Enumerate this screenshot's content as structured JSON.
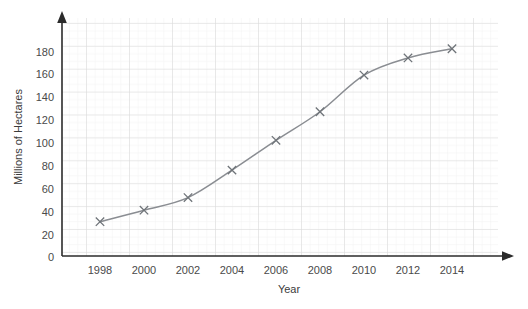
{
  "chart_data": {
    "type": "line",
    "title": "",
    "xlabel": "Year",
    "ylabel": "Millions of Hectares",
    "x": [
      1998,
      2000,
      2002,
      2004,
      2006,
      2008,
      2010,
      2012,
      2014
    ],
    "values": [
      30,
      40,
      51,
      75,
      101,
      126,
      158,
      173,
      181
    ],
    "categories": [
      "1998",
      "2000",
      "2002",
      "2004",
      "2006",
      "2008",
      "2010",
      "2012",
      "2014"
    ],
    "series": [
      {
        "name": "Millions of Hectares",
        "values": [
          30,
          40,
          51,
          75,
          101,
          126,
          158,
          173,
          181
        ]
      }
    ],
    "xlim": [
      1996,
      2016
    ],
    "ylim": [
      0,
      190
    ],
    "xticks": [
      "1998",
      "2000",
      "2002",
      "2004",
      "2006",
      "2008",
      "2010",
      "2012",
      "2014"
    ],
    "yticks": [
      "0",
      "20",
      "40",
      "60",
      "80",
      "100",
      "120",
      "140",
      "160",
      "180"
    ],
    "grid": true,
    "legend": "none",
    "marker": "x",
    "line_color": "#8a8d92",
    "marker_color": "#6f7479",
    "grid_color": "#dcdcdc",
    "minor_grid_color": "#efefef",
    "axis_color": "#2b2b2b",
    "text_color": "#4a4a4a",
    "background": "#ffffff"
  },
  "axes": {
    "y_title": "Millions of Hectares",
    "x_title": "Year",
    "y_tick_labels": [
      "180",
      "160",
      "140",
      "120",
      "100",
      "80",
      "60",
      "40",
      "20",
      "0"
    ],
    "x_tick_labels": [
      "1998",
      "2000",
      "2002",
      "2004",
      "2006",
      "2008",
      "2010",
      "2012",
      "2014"
    ]
  }
}
